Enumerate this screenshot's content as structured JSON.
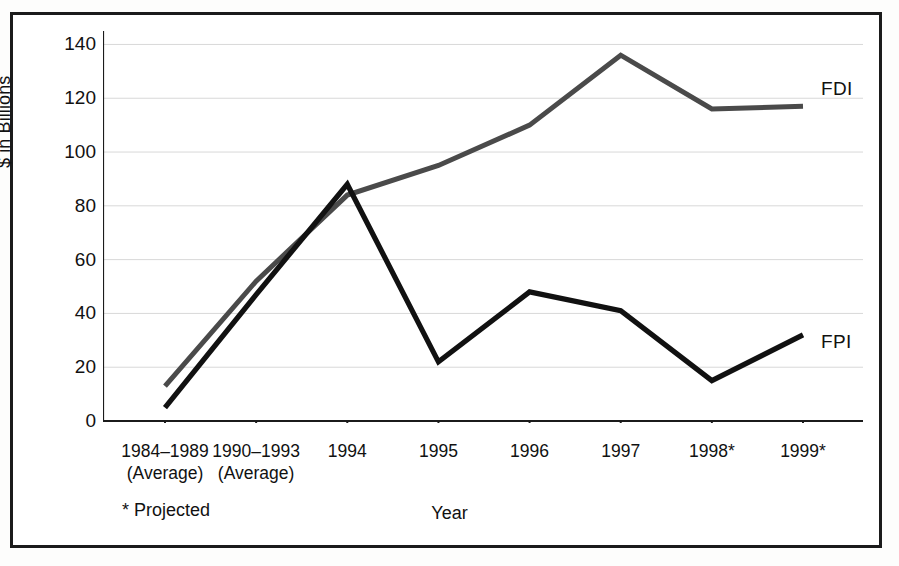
{
  "chart_data": {
    "type": "line",
    "title": "",
    "xlabel": "Year",
    "ylabel": "$ in Billions",
    "ylim": [
      0,
      145
    ],
    "yticks": [
      0,
      20,
      40,
      60,
      80,
      100,
      120,
      140
    ],
    "grid": true,
    "legend_position": "right-inline",
    "footnote": "* Projected",
    "categories": [
      "1984–1989\n(Average)",
      "1990–1993\n(Average)",
      "1994",
      "1995",
      "1996",
      "1997",
      "1998*",
      "1999*"
    ],
    "category_lines": [
      [
        "1984–1989",
        "(Average)"
      ],
      [
        "1990–1993",
        "(Average)"
      ],
      [
        "1994",
        ""
      ],
      [
        "1995",
        ""
      ],
      [
        "1996",
        ""
      ],
      [
        "1997",
        ""
      ],
      [
        "1998*",
        ""
      ],
      [
        "1999*",
        ""
      ]
    ],
    "series": [
      {
        "name": "FDI",
        "color": "#4a4a4a",
        "values": [
          13,
          52,
          84,
          95,
          110,
          136,
          116,
          117
        ]
      },
      {
        "name": "FPI",
        "color": "#111111",
        "values": [
          5,
          47,
          88,
          22,
          48,
          41,
          15,
          32
        ]
      }
    ]
  },
  "axis": {
    "y_title": "$ in Billions",
    "x_title": "Year"
  },
  "labels": {
    "fdi": "FDI",
    "fpi": "FPI",
    "projected_note": "* Projected"
  },
  "colors": {
    "fdi_line": "#4a4a4a",
    "fpi_line": "#111111",
    "grid": "#d8d8d8",
    "axis": "#1b1b1b",
    "frame": "#1b1b1b",
    "background": "#ffffff"
  }
}
